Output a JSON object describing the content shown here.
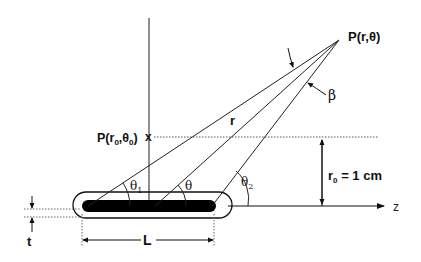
{
  "diagram": {
    "type": "line-source-geometry",
    "colors": {
      "ink": "#111111",
      "background": "#ffffff"
    },
    "labels": {
      "point_p": "P(r,θ)",
      "point_p0": "P(r",
      "point_p0_sub1": "0",
      "point_p0_mid": ",θ",
      "point_p0_sub2": "0",
      "point_p0_end": ")",
      "p0_marker": "x",
      "radius": "r",
      "beta": "β",
      "theta": "θ",
      "theta1": "θ",
      "theta1_sub": "1",
      "theta2": "θ",
      "theta2_sub": "2",
      "r0_main": "r",
      "r0_sub": "0",
      "r0_value": " = 1 cm",
      "z_axis": "z",
      "thickness": "t",
      "length": "L"
    },
    "elements": [
      "vertical-axis",
      "z-axis",
      "source-capsule",
      "active-rod",
      "ray-to-left-end",
      "ray-to-center",
      "ray-to-right-end",
      "r0-reference-line",
      "r0-dimension-arrow",
      "length-dimension",
      "thickness-dimension",
      "angle-arcs"
    ]
  }
}
